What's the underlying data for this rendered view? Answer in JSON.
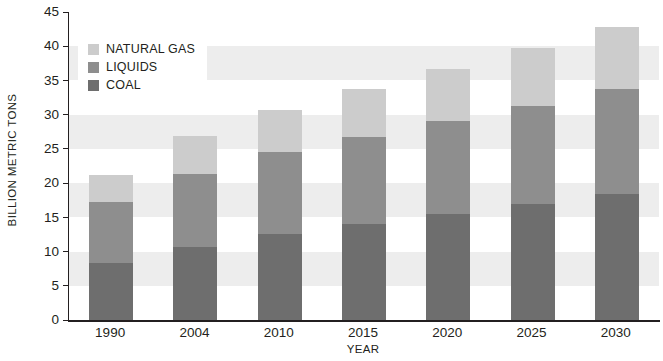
{
  "chart_data": {
    "type": "bar",
    "stacked": true,
    "title": "",
    "xlabel": "YEAR",
    "ylabel": "BILLION METRIC TONS",
    "categories": [
      "1990",
      "2004",
      "2010",
      "2015",
      "2020",
      "2025",
      "2030"
    ],
    "series": [
      {
        "name": "COAL",
        "color": "#6e6e6e",
        "values": [
          8.3,
          10.6,
          12.6,
          14.0,
          15.5,
          17.0,
          18.4
        ]
      },
      {
        "name": "LIQUIDS",
        "color": "#8e8e8e",
        "values": [
          9.0,
          10.8,
          11.9,
          12.8,
          13.6,
          14.3,
          15.4
        ]
      },
      {
        "name": "NATURAL GAS",
        "color": "#cccccc",
        "values": [
          3.9,
          5.5,
          6.2,
          7.0,
          7.6,
          8.4,
          9.0
        ]
      }
    ],
    "totals": [
      21.2,
      26.9,
      30.7,
      33.8,
      36.7,
      39.7,
      42.8
    ],
    "ylim": [
      0,
      45
    ],
    "ytick_step": 5,
    "yticks": [
      "45",
      "40",
      "35",
      "30",
      "25",
      "20",
      "15",
      "10",
      "5",
      "0"
    ],
    "grid": "horizontal-bands",
    "legend_position": "top-left"
  },
  "axes": {
    "y_title": "BILLION METRIC TONS",
    "x_title": "YEAR"
  },
  "legend": {
    "items": [
      {
        "label": "NATURAL GAS",
        "color": "#cccccc"
      },
      {
        "label": "LIQUIDS",
        "color": "#8e8e8e"
      },
      {
        "label": "COAL",
        "color": "#6e6e6e"
      }
    ]
  },
  "colors": {
    "natural_gas": "#cccccc",
    "liquids": "#8e8e8e",
    "coal": "#6e6e6e",
    "band": "#ededed",
    "axis": "#231f20",
    "background": "#ffffff"
  }
}
